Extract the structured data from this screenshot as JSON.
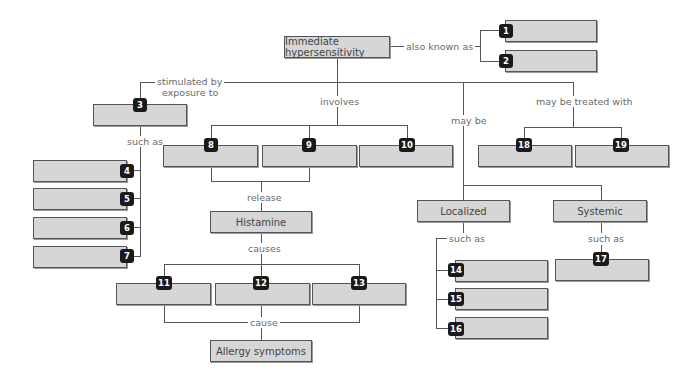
{
  "diagram": {
    "title": "Immediate hypersensitivity",
    "nodes": {
      "root": "Immediate hypersensitivity",
      "histamine": "Histamine",
      "allergy": "Allergy symptoms",
      "localized": "Localized",
      "systemic": "Systemic"
    },
    "links": {
      "also_known_as": "also known as",
      "stimulated_by": "stimulated by",
      "exposure_to": "exposure to",
      "involves": "involves",
      "may_be": "may be",
      "may_be_treated_with": "may be treated with",
      "such_as_3": "such as",
      "release": "release",
      "causes": "causes",
      "cause": "cause",
      "such_as_localized": "such as",
      "such_as_systemic": "such as"
    },
    "blanks": [
      "1",
      "2",
      "3",
      "4",
      "5",
      "6",
      "7",
      "8",
      "9",
      "10",
      "11",
      "12",
      "13",
      "14",
      "15",
      "16",
      "17",
      "18",
      "19"
    ],
    "colors": {
      "box_fill": "#d6d6d6",
      "box_border": "#555555",
      "badge": "#1a1a1a",
      "link_text": "#6a6a6a"
    }
  }
}
